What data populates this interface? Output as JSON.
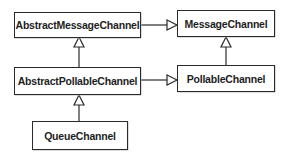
{
  "diagram": {
    "type": "uml-class-inheritance",
    "nodes": [
      {
        "id": "abstract_message_channel",
        "label": "AbstractMessageChannel"
      },
      {
        "id": "message_channel",
        "label": "MessageChannel"
      },
      {
        "id": "abstract_pollable_channel",
        "label": "AbstractPollableChannel"
      },
      {
        "id": "pollable_channel",
        "label": "PollableChannel"
      },
      {
        "id": "queue_channel",
        "label": "QueueChannel"
      }
    ],
    "edges": [
      {
        "from": "AbstractMessageChannel",
        "to": "MessageChannel",
        "kind": "generalization"
      },
      {
        "from": "AbstractPollableChannel",
        "to": "AbstractMessageChannel",
        "kind": "generalization"
      },
      {
        "from": "AbstractPollableChannel",
        "to": "PollableChannel",
        "kind": "generalization"
      },
      {
        "from": "PollableChannel",
        "to": "MessageChannel",
        "kind": "generalization"
      },
      {
        "from": "QueueChannel",
        "to": "AbstractPollableChannel",
        "kind": "generalization"
      }
    ],
    "colors": {
      "line": "#2a2a2a",
      "text": "#1e1e1e",
      "background": "#ffffff"
    }
  }
}
